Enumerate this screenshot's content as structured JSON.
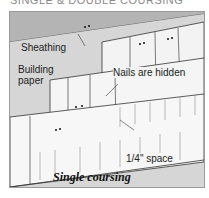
{
  "title": "SINGLE & DOUBLE COURSING",
  "labels": {
    "sheathing": "Sheathing",
    "building_paper_1": "Building",
    "building_paper_2": "paper",
    "nails": "Nails are hidden",
    "space": "1/4\" space"
  },
  "caption": "Single coursing",
  "colors": {
    "background": "#c9c9c9",
    "shingle": "#f2f2f2",
    "sheathing": "#b4b4b4",
    "line": "#333333"
  }
}
